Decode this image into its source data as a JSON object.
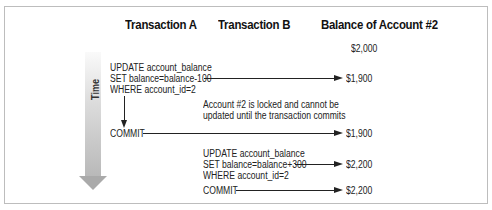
{
  "headers": {
    "transaction_a": "Transaction A",
    "transaction_b": "Transaction B",
    "balance": "Balance of Account #2"
  },
  "time_label": "Time",
  "balances": [
    "$2,000",
    "$1,900",
    "$1,900",
    "$2,200",
    "$2,200"
  ],
  "transaction_a": {
    "update_lines": [
      "UPDATE account_balance",
      "SET balance=balance-100",
      "WHERE account_id=2"
    ],
    "commit": "COMMIT"
  },
  "transaction_b": {
    "update_lines": [
      "UPDATE account_balance",
      "SET balance=balance+300",
      "WHERE account_id=2"
    ],
    "commit": "COMMIT"
  },
  "note_lines": [
    "Account #2 is locked and cannot be",
    "updated until the transaction commits"
  ]
}
